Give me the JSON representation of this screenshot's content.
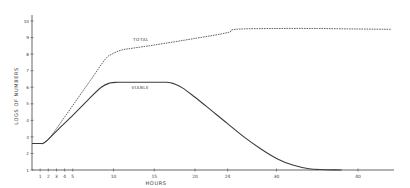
{
  "chart_data": {
    "type": "line",
    "title": "",
    "xlabel": "HOURS",
    "ylabel": "LOGS OF NUMBERS",
    "xlim": [
      0,
      44
    ],
    "ylim": [
      1,
      10
    ],
    "x_ticks": [
      1,
      2,
      3,
      4,
      5,
      10,
      15,
      20,
      24,
      30,
      40
    ],
    "y_ticks": [
      1,
      2,
      3,
      4,
      5,
      6,
      7,
      8,
      9,
      10
    ],
    "grid": false,
    "legend": "inline labels",
    "series": [
      {
        "name": "TOTAL",
        "style": "dashed",
        "label_at": [
          12.4,
          8.8
        ],
        "points": [
          [
            0,
            2.6
          ],
          [
            1.0,
            2.6
          ],
          [
            1.4,
            2.62
          ],
          [
            2.0,
            2.85
          ],
          [
            3.0,
            3.5
          ],
          [
            5.0,
            4.9
          ],
          [
            7.0,
            6.3
          ],
          [
            9.0,
            7.7
          ],
          [
            9.8,
            8.0
          ],
          [
            11.0,
            8.25
          ],
          [
            12.5,
            8.37
          ],
          [
            15.0,
            8.55
          ],
          [
            20.0,
            8.95
          ],
          [
            24.0,
            9.3
          ],
          [
            25.0,
            9.5
          ],
          [
            30.0,
            9.55
          ],
          [
            35.0,
            9.55
          ],
          [
            40.0,
            9.52
          ],
          [
            44.0,
            9.5
          ]
        ]
      },
      {
        "name": "VIABLE",
        "style": "solid",
        "label_at": [
          12.2,
          5.9
        ],
        "points": [
          [
            0,
            2.6
          ],
          [
            1.0,
            2.6
          ],
          [
            1.4,
            2.62
          ],
          [
            2.0,
            2.85
          ],
          [
            3.0,
            3.35
          ],
          [
            5.0,
            4.3
          ],
          [
            7.0,
            5.3
          ],
          [
            8.5,
            6.0
          ],
          [
            9.5,
            6.25
          ],
          [
            10.5,
            6.3
          ],
          [
            14.0,
            6.3
          ],
          [
            16.5,
            6.3
          ],
          [
            17.5,
            6.2
          ],
          [
            18.5,
            5.95
          ],
          [
            20.0,
            5.4
          ],
          [
            22.0,
            4.6
          ],
          [
            24.0,
            3.8
          ],
          [
            26.0,
            3.0
          ],
          [
            28.0,
            2.3
          ],
          [
            30.0,
            1.7
          ],
          [
            32.0,
            1.3
          ],
          [
            34.0,
            1.08
          ],
          [
            36.0,
            1.02
          ],
          [
            38.0,
            1.0
          ]
        ]
      }
    ]
  }
}
